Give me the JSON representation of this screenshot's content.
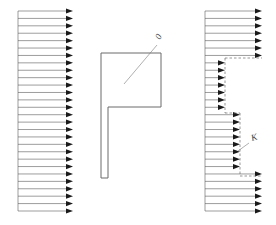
{
  "diagram": {
    "canvas": {
      "width": 276,
      "height": 225,
      "background": "#ffffff"
    },
    "style": {
      "line_color": "#5a5a5a",
      "arrow_color": "#1a1a1a",
      "outline_color": "#6a6a6a",
      "leader_color": "#7a7a7a",
      "label_color": "#3a3a3a",
      "line_width": 0.6,
      "outline_width": 1.0
    },
    "labels": [
      {
        "id": "label-o",
        "text": "0",
        "x": 160,
        "y": 40,
        "rotate": -62,
        "leader": {
          "x1": 157,
          "y1": 45,
          "x2": 124,
          "y2": 84
        }
      },
      {
        "id": "label-k",
        "text": "K",
        "x": 252,
        "y": 141,
        "rotate": -16,
        "leader": {
          "x1": 249,
          "y1": 143,
          "x2": 238,
          "y2": 151
        }
      }
    ],
    "arrow_arrays": [
      {
        "name": "left-arrow-array",
        "tail_x": 18,
        "y_start": 11,
        "y_end": 211,
        "count": 28,
        "segments": [
          {
            "from": 0,
            "to": 27,
            "tip_x": 73
          }
        ],
        "spine": {
          "x": 18,
          "y1": 11,
          "y2": 211
        }
      },
      {
        "name": "right-arrow-array",
        "tail_x": 205,
        "y_start": 11,
        "y_end": 211,
        "count": 28,
        "segments": [
          {
            "from": 0,
            "to": 6,
            "tip_x": 262
          },
          {
            "from": 7,
            "to": 13,
            "tip_x": 225
          },
          {
            "from": 14,
            "to": 21,
            "tip_x": 240
          },
          {
            "from": 22,
            "to": 27,
            "tip_x": 262
          }
        ],
        "spine": {
          "x": 205,
          "y1": 11,
          "y2": 211
        },
        "step_edges": [
          {
            "x1": 225,
            "y1": 58,
            "x2": 262,
            "y2": 58
          },
          {
            "x1": 225,
            "y1": 58,
            "x2": 225,
            "y2": 113
          },
          {
            "x1": 225,
            "y1": 113,
            "x2": 240,
            "y2": 113
          },
          {
            "x1": 240,
            "y1": 113,
            "x2": 240,
            "y2": 176
          },
          {
            "x1": 240,
            "y1": 176,
            "x2": 262,
            "y2": 176
          }
        ]
      }
    ],
    "polygon": {
      "name": "center-polygon",
      "points": "101,53 161,53 161,107 108,107 108,178 101,178"
    },
    "arrow_head": {
      "length": 7,
      "half_width": 2.6
    }
  }
}
